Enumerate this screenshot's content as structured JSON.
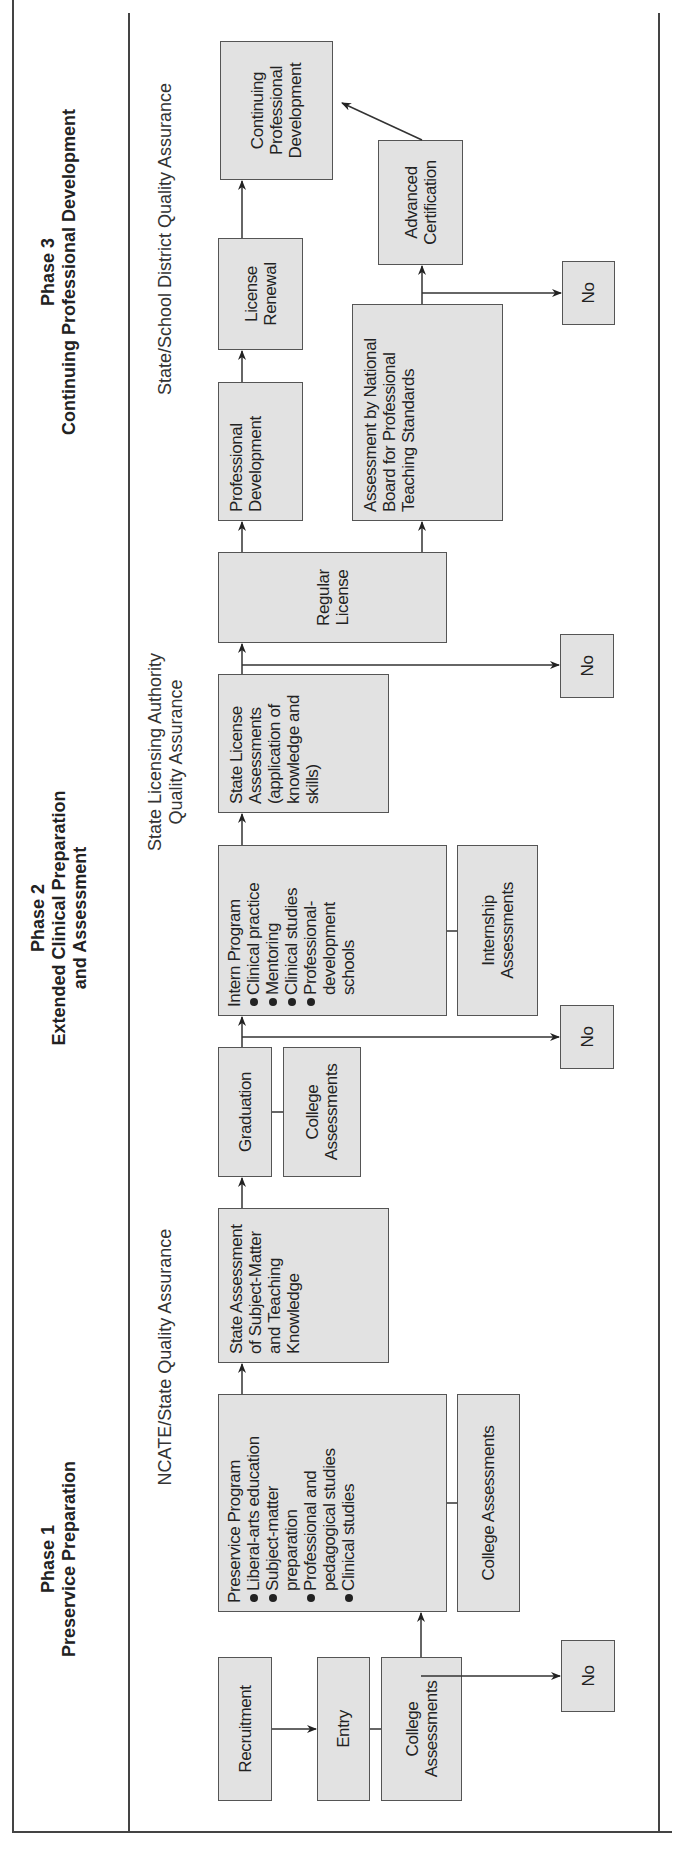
{
  "phases": [
    {
      "label": "Phase 1",
      "title": "Preservice Preparation"
    },
    {
      "label": "Phase 2",
      "title": "Extended Clinical Preparation",
      "title2": "and Assessment"
    },
    {
      "label": "Phase 3",
      "title": "Continuing Professional Development"
    }
  ],
  "quality_assurance": {
    "phase1": "NCATE/State Quality Assurance",
    "phase2_line1": "State Licensing Authority",
    "phase2_line2": "Quality Assurance",
    "phase3": "State/School District Quality Assurance"
  },
  "nodes": {
    "recruitment": "Recruitment",
    "entry": "Entry",
    "college_assessments_entry": "College Assessments",
    "no_entry": "No",
    "preservice_program": {
      "title": "Preservice Program",
      "items": [
        "Liberal-arts education",
        "Subject-matter preparation",
        "Professional and pedagogical studies",
        "Clinical studies"
      ]
    },
    "college_assessments_preservice": "College Assessments",
    "state_assessment": "State Assessment of Subject-Matter and Teaching Knowledge",
    "graduation": "Graduation",
    "college_assessments_graduation": "College Assessments",
    "no_graduation": "No",
    "intern_program": {
      "title": "Intern Program",
      "items": [
        "Clinical practice",
        "Mentoring",
        "Clinical studies",
        "Professional-development schools"
      ]
    },
    "internship_assessments": "Internship Assessments",
    "state_license_assessments": "State License Assessments (application of knowledge and skills)",
    "no_license": "No",
    "regular_license": "Regular License",
    "professional_development": "Professional Development",
    "nbpts_assessment": "Assessment by National Board for Professional Teaching Standards",
    "license_renewal": "License Renewal",
    "advanced_certification": "Advanced Certification",
    "no_nbpts": "No",
    "continuing_professional_development": "Continuing Professional Development"
  }
}
